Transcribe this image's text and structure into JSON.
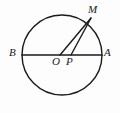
{
  "figure": {
    "kind": "geometry-diagram",
    "background_color": "#fdfdfd",
    "stroke_color": "#1a1a1a",
    "label_color": "#1a1a1a",
    "width": 120,
    "height": 113
  },
  "circle": {
    "name": "main-circle",
    "center_x": 62,
    "center_y": 55,
    "radius": 40,
    "stroke_width": 1.4,
    "fill": "none"
  },
  "points": {
    "B": {
      "label": "B",
      "x": 22,
      "y": 55
    },
    "A": {
      "label": "A",
      "x": 102,
      "y": 55
    },
    "O": {
      "label": "O",
      "x": 60,
      "y": 55
    },
    "P": {
      "label": "P",
      "x": 71,
      "y": 55
    },
    "M": {
      "label": "M",
      "x": 91,
      "y": 18
    }
  },
  "segments": [
    {
      "name": "diameter-BA",
      "from": "B",
      "to": "A",
      "stroke_width": 1.6
    },
    {
      "name": "segment-OM",
      "from": "O",
      "to": "M",
      "stroke_width": 1.4
    },
    {
      "name": "segment-PM",
      "from": "P",
      "to": "M",
      "stroke_width": 1.4
    }
  ],
  "labels": [
    {
      "id": "label-B",
      "text": "B"
    },
    {
      "id": "label-A",
      "text": "A"
    },
    {
      "id": "label-M",
      "text": "M"
    },
    {
      "id": "label-O",
      "text": "O"
    },
    {
      "id": "label-P",
      "text": "P"
    }
  ]
}
